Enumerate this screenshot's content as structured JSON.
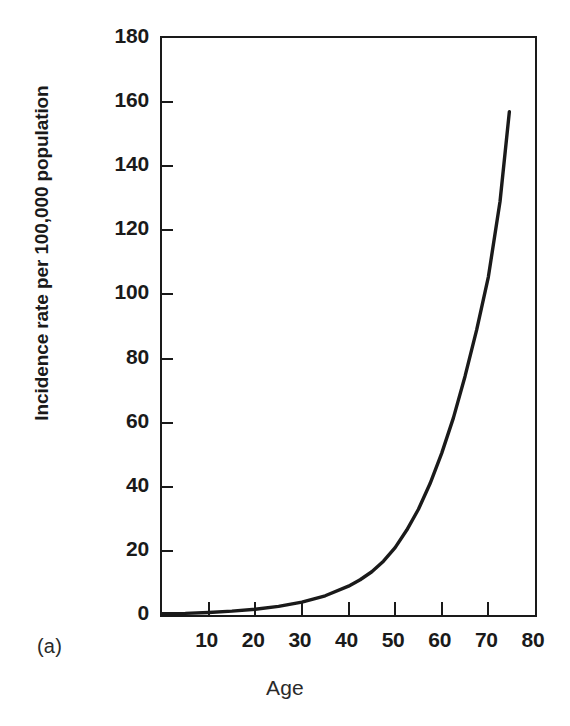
{
  "figure": {
    "panel_label": "(a)",
    "background_color": "#ffffff",
    "ink_color": "#1a1a1a"
  },
  "chart_data": {
    "type": "line",
    "title": "",
    "subtitle": "",
    "xlabel": "Age",
    "ylabel": "Incidence rate per 100,000 population",
    "xlim": [
      0,
      80
    ],
    "ylim": [
      0,
      180
    ],
    "xticks": [
      10,
      20,
      30,
      40,
      50,
      60,
      70,
      80
    ],
    "xticklabels": [
      "10",
      "20",
      "30",
      "40",
      "50",
      "60",
      "70",
      "80"
    ],
    "yticks": [
      0,
      20,
      40,
      60,
      80,
      100,
      120,
      140,
      160,
      180
    ],
    "yticklabels": [
      "0",
      "20",
      "40",
      "60",
      "80",
      "100",
      "120",
      "140",
      "160",
      "180"
    ],
    "grid": false,
    "legend": false,
    "legend_position": "none",
    "tick_direction": "in",
    "line_color": "#1a1a1a",
    "line_width": 3.4,
    "series": [
      {
        "name": "Incidence rate",
        "x": [
          0,
          5,
          10,
          15,
          20,
          25,
          30,
          35,
          40,
          42.5,
          45,
          47.5,
          50,
          52.5,
          55,
          57.5,
          60,
          62.5,
          65,
          67.5,
          70,
          72.5,
          74.5
        ],
        "y": [
          0.4,
          0.5,
          0.8,
          1.2,
          1.8,
          2.7,
          4.0,
          6.0,
          9.0,
          11.0,
          13.5,
          16.8,
          21.0,
          26.5,
          33.0,
          41.0,
          50.5,
          61.5,
          74.5,
          89.0,
          105.5,
          129.0,
          157.0
        ]
      }
    ],
    "annotations": [
      {
        "text": "(a)",
        "position": "bottom-left-outside"
      }
    ]
  }
}
